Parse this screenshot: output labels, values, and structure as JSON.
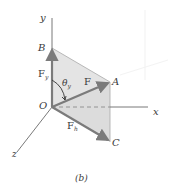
{
  "figure": {
    "caption": "(b)",
    "axes": {
      "x": "x",
      "y": "y",
      "z": "z"
    },
    "points": {
      "origin": "O",
      "A": "A",
      "B": "B",
      "C": "C"
    },
    "vectors": {
      "F": "F",
      "Fy": {
        "base": "F",
        "subscript": "y"
      },
      "Fh": {
        "base": "F",
        "subscript": "h"
      }
    },
    "angle": {
      "base": "θ",
      "subscript": "y"
    },
    "colors": {
      "axis": "#6a6a6a",
      "vector": "#7b7b7b",
      "plane_fill": "#e6e6e6",
      "plane_edge": "#9a9a9a",
      "text": "#3a3a3a",
      "background": "#ffffff",
      "ghost": "#f2f2f2"
    }
  }
}
